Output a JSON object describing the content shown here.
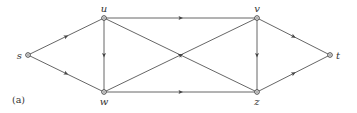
{
  "figure": {
    "caption": "(a)",
    "nodes": [
      {
        "id": "s",
        "label": "s",
        "x": 28,
        "y": 55,
        "label_pos": "left"
      },
      {
        "id": "u",
        "label": "u",
        "x": 104,
        "y": 18,
        "label_pos": "top"
      },
      {
        "id": "w",
        "label": "w",
        "x": 104,
        "y": 92,
        "label_pos": "bottom"
      },
      {
        "id": "v",
        "label": "v",
        "x": 257,
        "y": 18,
        "label_pos": "top"
      },
      {
        "id": "z",
        "label": "z",
        "x": 257,
        "y": 92,
        "label_pos": "bottom"
      },
      {
        "id": "t",
        "label": "t",
        "x": 330,
        "y": 55,
        "label_pos": "right"
      }
    ],
    "edges": [
      {
        "from": "s",
        "to": "u"
      },
      {
        "from": "s",
        "to": "w"
      },
      {
        "from": "u",
        "to": "w"
      },
      {
        "from": "u",
        "to": "v"
      },
      {
        "from": "w",
        "to": "z"
      },
      {
        "from": "w",
        "to": "v"
      },
      {
        "from": "z",
        "to": "u"
      },
      {
        "from": "v",
        "to": "z"
      },
      {
        "from": "v",
        "to": "t"
      },
      {
        "from": "z",
        "to": "t"
      }
    ],
    "colors": {
      "edge": "#555555",
      "node_stroke": "#444444",
      "text": "#333333",
      "background": "#ffffff"
    }
  }
}
